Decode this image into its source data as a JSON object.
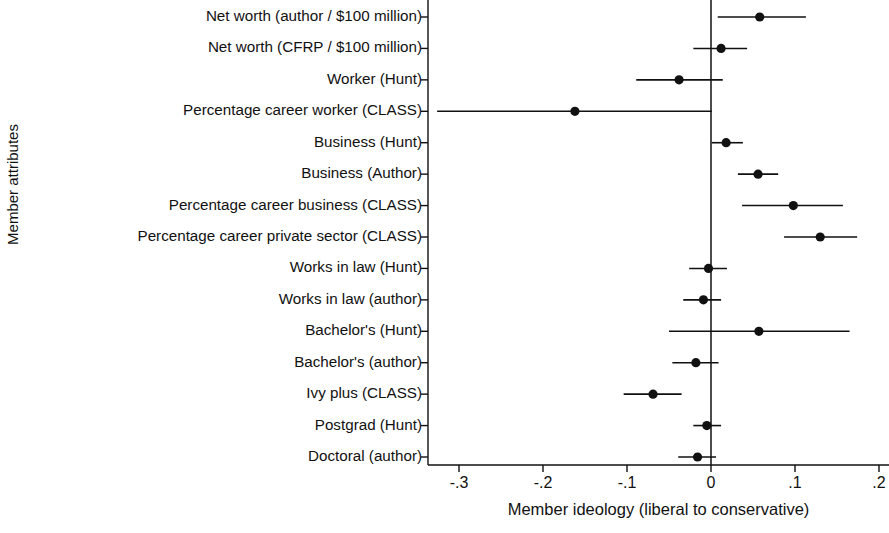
{
  "chart_data": {
    "type": "scatter",
    "title": "",
    "xlabel": "Member ideology (liberal to conservative)",
    "ylabel": "Member attributes",
    "xlim": [
      -0.34,
      0.215
    ],
    "xticks": [
      -0.3,
      -0.2,
      -0.1,
      0,
      0.1,
      0.2
    ],
    "xtick_labels": [
      "-.3",
      "-.2",
      "-.1",
      "0",
      ".1",
      ".2"
    ],
    "grid": false,
    "legend": null,
    "reference_line": 0,
    "categories": [
      "Net worth (author / $100 million)",
      "Net worth (CFRP / $100 million)",
      "Worker (Hunt)",
      "Percentage career worker (CLASS)",
      "Business (Hunt)",
      "Business (Author)",
      "Percentage career business (CLASS)",
      "Percentage career private sector (CLASS)",
      "Works in law (Hunt)",
      "Works in law (author)",
      "Bachelor's (Hunt)",
      "Bachelor's (author)",
      "Ivy plus (CLASS)",
      "Postgrad (Hunt)",
      "Doctoral (author)"
    ],
    "values": [
      0.058,
      0.012,
      -0.038,
      -0.162,
      0.018,
      0.056,
      0.098,
      0.13,
      -0.003,
      -0.009,
      0.057,
      -0.018,
      -0.069,
      -0.005,
      -0.016
    ],
    "ci_low": [
      0.008,
      -0.021,
      -0.089,
      -0.326,
      0.001,
      0.032,
      0.037,
      0.087,
      -0.026,
      -0.033,
      -0.05,
      -0.046,
      -0.104,
      -0.021,
      -0.039
    ],
    "ci_high": [
      0.113,
      0.043,
      0.014,
      0.001,
      0.038,
      0.08,
      0.157,
      0.174,
      0.019,
      0.012,
      0.165,
      0.009,
      -0.035,
      0.012,
      0.006
    ],
    "series": [
      {
        "name": "Point estimate with 95% confidence interval",
        "values": [
          0.058,
          0.012,
          -0.038,
          -0.162,
          0.018,
          0.056,
          0.098,
          0.13,
          -0.003,
          -0.009,
          0.057,
          -0.018,
          -0.069,
          -0.005,
          -0.016
        ]
      }
    ],
    "marker_color": "#111111",
    "line_color": "#111111"
  },
  "axis": {
    "y_title": "Member attributes",
    "x_title": "Member ideology (liberal to conservative)",
    "x_tick_labels": [
      "-.3",
      "-.2",
      "-.1",
      "0",
      ".1",
      ".2"
    ]
  },
  "categories": [
    "Net worth (author / $100 million)",
    "Net worth (CFRP / $100 million)",
    "Worker (Hunt)",
    "Percentage career worker (CLASS)",
    "Business (Hunt)",
    "Business (Author)",
    "Percentage career business (CLASS)",
    "Percentage career private sector (CLASS)",
    "Works in law (Hunt)",
    "Works in law (author)",
    "Bachelor's (Hunt)",
    "Bachelor's (author)",
    "Ivy plus (CLASS)",
    "Postgrad (Hunt)",
    "Doctoral (author)"
  ]
}
